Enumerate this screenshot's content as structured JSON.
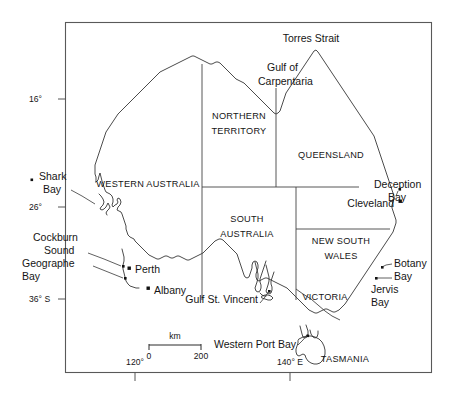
{
  "figure": {
    "kind": "locality-map",
    "region": "Australia",
    "background_color": "#ffffff",
    "frame_color": "#595959",
    "coast_color": "#2b2b2b",
    "border_color": "#444444",
    "marker_color": "#111111"
  },
  "states": [
    {
      "id": "wa",
      "label_line1": "WESTERN AUSTRALIA",
      "label_line2": ""
    },
    {
      "id": "nt",
      "label_line1": "NORTHERN",
      "label_line2": "TERRITORY"
    },
    {
      "id": "qld",
      "label_line1": "QUEENSLAND",
      "label_line2": ""
    },
    {
      "id": "sa",
      "label_line1": "SOUTH",
      "label_line2": "AUSTRALIA"
    },
    {
      "id": "nsw",
      "label_line1": "NEW SOUTH",
      "label_line2": "WALES"
    },
    {
      "id": "vic",
      "label_line1": "VICTORIA",
      "label_line2": ""
    },
    {
      "id": "tas",
      "label_line1": "TASMANIA",
      "label_line2": ""
    }
  ],
  "water_labels": [
    {
      "id": "torres-strait",
      "line1": "Torres Strait",
      "line2": ""
    },
    {
      "id": "gulf-of-carpentaria",
      "line1": "Gulf of",
      "line2": "Carpentaria"
    },
    {
      "id": "shark-bay",
      "line1": "Shark",
      "line2": "Bay"
    },
    {
      "id": "cockburn-sound",
      "line1": "Cockburn",
      "line2": "Sound"
    },
    {
      "id": "geographe-bay",
      "line1": "Geographe",
      "line2": "Bay"
    },
    {
      "id": "gulf-st-vincent",
      "line1": "Gulf St. Vincent",
      "line2": ""
    },
    {
      "id": "western-port-bay",
      "line1": "Western Port Bay",
      "line2": ""
    },
    {
      "id": "deception-bay",
      "line1": "Deception",
      "line2": "Bay"
    },
    {
      "id": "botany-bay",
      "line1": "Botany",
      "line2": "Bay"
    },
    {
      "id": "jervis-bay",
      "line1": "Jervis",
      "line2": "Bay"
    }
  ],
  "cities": [
    {
      "id": "perth",
      "label": "Perth"
    },
    {
      "id": "albany",
      "label": "Albany"
    },
    {
      "id": "cleveland",
      "label": "Cleveland"
    }
  ],
  "graticule": {
    "latitudes": [
      {
        "id": "lat-16",
        "label": "16°"
      },
      {
        "id": "lat-26",
        "label": "26°"
      },
      {
        "id": "lat-36",
        "label": "36° S"
      }
    ],
    "longitudes": [
      {
        "id": "lon-120",
        "label": "120°"
      },
      {
        "id": "lon-140",
        "label": "140° E"
      }
    ]
  },
  "scale_bar": {
    "unit_label": "km",
    "min_label": "0",
    "max_label": "200"
  }
}
